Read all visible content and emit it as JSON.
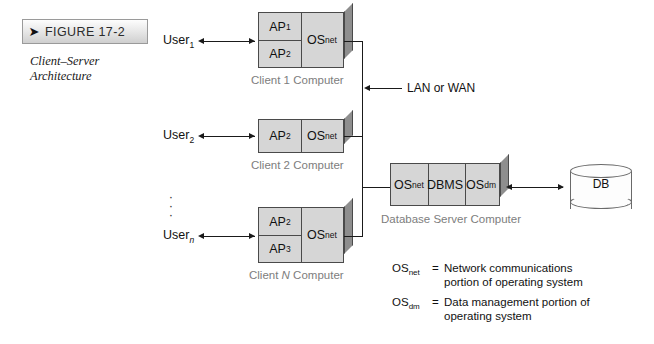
{
  "figure": {
    "badge_arrow": "➤",
    "badge_label": "FIGURE 17-2",
    "caption_line1": "Client–Server",
    "caption_line2": "Architecture"
  },
  "users": [
    {
      "name": "User",
      "sub": "1"
    },
    {
      "name": "User",
      "sub": "2"
    },
    {
      "name": "User",
      "sub": "n"
    }
  ],
  "ellipsis": "·",
  "clients": [
    {
      "caption_prefix": "Client ",
      "caption_id": "1",
      "caption_suffix": " Computer",
      "apps": [
        {
          "name": "AP",
          "sub": "1"
        },
        {
          "name": "AP",
          "sub": "2"
        }
      ],
      "os": {
        "name": "OS",
        "sub": "net"
      }
    },
    {
      "caption_prefix": "Client ",
      "caption_id": "2",
      "caption_suffix": " Computer",
      "apps": [
        {
          "name": "AP",
          "sub": "2"
        }
      ],
      "os": {
        "name": "OS",
        "sub": "net"
      }
    },
    {
      "caption_prefix": "Client ",
      "caption_id": "N",
      "caption_suffix": " Computer",
      "apps": [
        {
          "name": "AP",
          "sub": "2"
        },
        {
          "name": "AP",
          "sub": "3"
        }
      ],
      "os": {
        "name": "OS",
        "sub": "net"
      }
    }
  ],
  "network": {
    "label": "LAN or WAN"
  },
  "server": {
    "caption": "Database Server Computer",
    "cells": [
      {
        "name": "OS",
        "sub": "net"
      },
      {
        "name": "DBMS",
        "sub": ""
      },
      {
        "name": "OS",
        "sub": "dm"
      }
    ]
  },
  "database": {
    "label": "DB"
  },
  "legend": [
    {
      "key_name": "OS",
      "key_sub": "net",
      "eq": "=",
      "text_line1": "Network communications",
      "text_line2": "portion of operating system"
    },
    {
      "key_name": "OS",
      "key_sub": "dm",
      "eq": "=",
      "text_line1": "Data management portion of",
      "text_line2": "operating system"
    }
  ],
  "colors": {
    "box_face": "#d6d6d6",
    "box_side": "#8e8e8e",
    "line": "#1a1a1a",
    "caption": "#7d7d7d"
  }
}
